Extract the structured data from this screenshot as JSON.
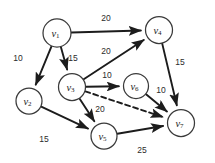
{
  "figure": {
    "background_color": "#ffffff",
    "edge_color": "#1c1c1c",
    "node_stroke_color": "#3a3a3a",
    "node_fill_color": "#ffffff",
    "label_color": "#2b2b2b"
  },
  "chart_data": {
    "type": "diagram",
    "diagram_kind": "directed-weighted-graph",
    "title": "",
    "nodes": [
      {
        "id": "v1",
        "label": "v",
        "subscript": "1",
        "x": 57,
        "y": 33,
        "r": 14
      },
      {
        "id": "v2",
        "label": "v",
        "subscript": "2",
        "x": 29,
        "y": 101,
        "r": 13
      },
      {
        "id": "v3",
        "label": "v",
        "subscript": "3",
        "x": 72,
        "y": 87,
        "r": 13.5
      },
      {
        "id": "v4",
        "label": "v",
        "subscript": "4",
        "x": 159,
        "y": 30,
        "r": 13.5
      },
      {
        "id": "v5",
        "label": "v",
        "subscript": "5",
        "x": 104,
        "y": 136,
        "r": 13
      },
      {
        "id": "v6",
        "label": "v",
        "subscript": "6",
        "x": 136,
        "y": 86,
        "r": 12.5
      },
      {
        "id": "v7",
        "label": "v",
        "subscript": "7",
        "x": 181,
        "y": 123,
        "r": 13.5
      }
    ],
    "edges": [
      {
        "id": "e-v1-v4",
        "from": "v1",
        "to": "v4",
        "weight": "20",
        "style": "solid",
        "directed": true,
        "label_x": 106,
        "label_y": 18
      },
      {
        "id": "e-v1-v2",
        "from": "v1",
        "to": "v2",
        "weight": "10",
        "style": "solid",
        "directed": true,
        "label_x": 18,
        "label_y": 58
      },
      {
        "id": "e-v1-v3",
        "from": "v1",
        "to": "v3",
        "weight": "15",
        "style": "solid",
        "directed": true,
        "label_x": 73,
        "label_y": 58
      },
      {
        "id": "e-v3-v4",
        "from": "v3",
        "to": "v4",
        "weight": "20",
        "style": "solid",
        "directed": true,
        "label_x": 106,
        "label_y": 51
      },
      {
        "id": "e-v3-v6",
        "from": "v3",
        "to": "v6",
        "weight": "10",
        "style": "solid",
        "directed": true,
        "label_x": 107,
        "label_y": 75
      },
      {
        "id": "e-v3-v5",
        "from": "v3",
        "to": "v5",
        "weight": "",
        "style": "solid",
        "directed": true,
        "label_x": 0,
        "label_y": 0
      },
      {
        "id": "e-v3-v7",
        "from": "v3",
        "to": "v7",
        "weight": "20",
        "style": "dashed",
        "directed": true,
        "label_x": 100,
        "label_y": 109
      },
      {
        "id": "e-v4-v7",
        "from": "v4",
        "to": "v7",
        "weight": "15",
        "style": "solid",
        "directed": true,
        "label_x": 180,
        "label_y": 62
      },
      {
        "id": "e-v6-v7",
        "from": "v6",
        "to": "v7",
        "weight": "10",
        "style": "solid",
        "directed": true,
        "label_x": 161,
        "label_y": 90
      },
      {
        "id": "e-v2-v5",
        "from": "v2",
        "to": "v5",
        "weight": "15",
        "style": "solid",
        "directed": true,
        "label_x": 44,
        "label_y": 139
      },
      {
        "id": "e-v5-v7",
        "from": "v5",
        "to": "v7",
        "weight": "25",
        "style": "solid",
        "directed": true,
        "label_x": 142,
        "label_y": 150
      }
    ]
  }
}
